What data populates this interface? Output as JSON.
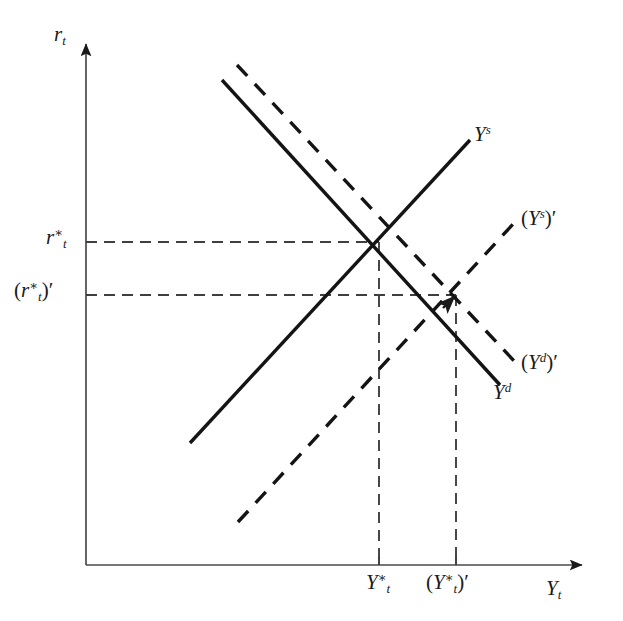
{
  "figure": {
    "type": "economics-supply-demand-diagram",
    "width": 623,
    "height": 621,
    "background_color": "#ffffff",
    "line_color": "#1a1a1a",
    "axis_color": "#444444",
    "dash_color": "#3a3a3a"
  },
  "axes": {
    "origin": {
      "x": 86,
      "y": 565
    },
    "y_axis": {
      "label": "r",
      "subscript": "t",
      "top_y": 38,
      "arrow": true
    },
    "x_axis": {
      "label": "Y",
      "subscript": "t",
      "right_x": 588,
      "arrow": true
    }
  },
  "curves": [
    {
      "id": "supply-original",
      "label_base": "Y",
      "label_sup": "s",
      "style": "solid",
      "x1": 190,
      "y1": 443,
      "x2": 470,
      "y2": 140,
      "label_x": 474,
      "label_y": 124
    },
    {
      "id": "supply-shifted",
      "label_base": "Y",
      "label_sup": "s",
      "label_prime": "′",
      "style": "dashed",
      "x1": 238,
      "y1": 522,
      "x2": 515,
      "y2": 222,
      "label_x": 521,
      "label_y": 208
    },
    {
      "id": "demand-original",
      "label_base": "Y",
      "label_sup": "d",
      "style": "solid",
      "x1": 222,
      "y1": 80,
      "x2": 500,
      "y2": 385,
      "label_x": 493,
      "label_y": 382
    },
    {
      "id": "demand-shifted",
      "label_base": "Y",
      "label_sup": "d",
      "label_prime": "′",
      "style": "dashed",
      "x1": 237,
      "y1": 65,
      "x2": 516,
      "y2": 363,
      "label_x": 521,
      "label_y": 352
    }
  ],
  "equilibria": [
    {
      "id": "equilibrium-original",
      "x": 379,
      "y": 242,
      "y_label_base": "r",
      "y_label_sub": "t",
      "y_label_star": "∗",
      "y_label_primed": false,
      "x_label_base": "Y",
      "x_label_sub": "t",
      "x_label_star": "∗",
      "x_label_primed": false,
      "y_tick_label_x": 36,
      "y_tick_label_y": 227,
      "x_tick_label_x": 364,
      "x_tick_label_y": 572
    },
    {
      "id": "equilibrium-new",
      "x": 456,
      "y": 295,
      "y_label_base": "r",
      "y_label_sub": "t",
      "y_label_star": "∗",
      "y_label_primed": true,
      "x_label_base": "Y",
      "x_label_sub": "t",
      "x_label_star": "∗",
      "x_label_primed": true,
      "y_tick_label_x": 14,
      "y_tick_label_y": 280,
      "x_tick_label_x": 426,
      "x_tick_label_y": 572,
      "pointer_arrow": true
    }
  ],
  "guide_lines": [
    {
      "id": "guide-h-1",
      "x1": 86,
      "y1": 242,
      "x2": 379,
      "y2": 242,
      "orientation": "horizontal"
    },
    {
      "id": "guide-h-2",
      "x1": 86,
      "y1": 295,
      "x2": 456,
      "y2": 295,
      "orientation": "horizontal"
    },
    {
      "id": "guide-v-1",
      "x1": 379,
      "y1": 242,
      "x2": 379,
      "y2": 565,
      "orientation": "vertical"
    },
    {
      "id": "guide-v-2",
      "x1": 456,
      "y1": 295,
      "x2": 456,
      "y2": 565,
      "orientation": "vertical"
    }
  ],
  "glyphs": {
    "prime": "′",
    "star": "∗",
    "lparen": "(",
    "rparen": ")"
  }
}
